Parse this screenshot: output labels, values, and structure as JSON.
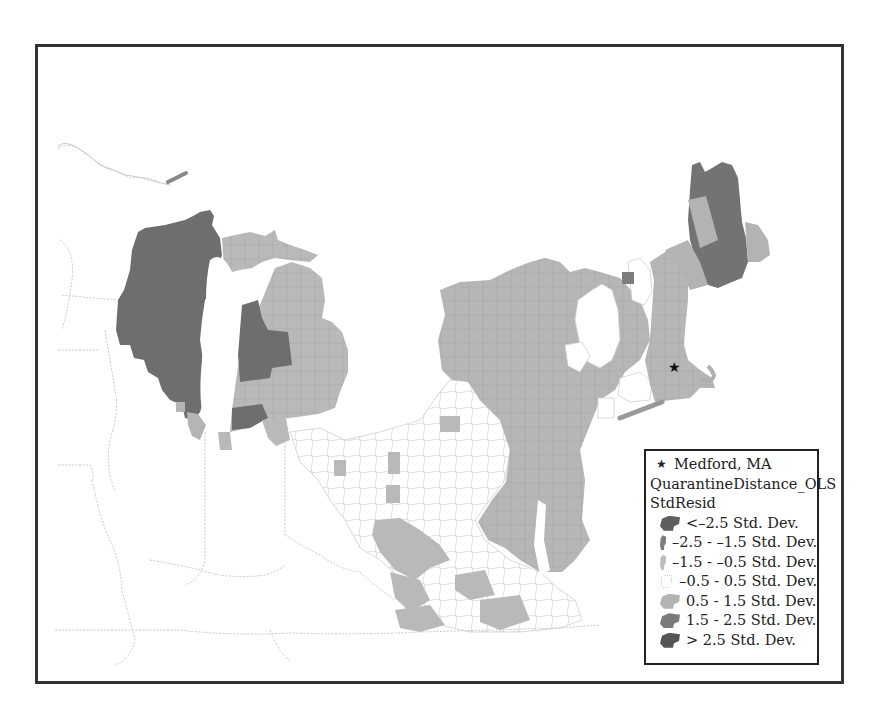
{
  "map": {
    "title": "",
    "colors": {
      "lt_-2.5": "#5e5e5e",
      "-2.5_-1.5": "#7d7d7d",
      "-1.5_-0.5": "#bdbdbd",
      "-0.5_0.5": "#ffffff",
      "0.5_1.5": "#b4b4b4",
      "1.5_2.5": "#7a7a7a",
      "gt_2.5": "#555555",
      "boundary": "#c8c8c8",
      "frame": "#333333"
    },
    "point_marker": {
      "label": "Medford, MA",
      "icon": "star-icon",
      "x": 675,
      "y": 369
    }
  },
  "legend": {
    "marker_label": "Medford, MA",
    "layer_name": "QuarantineDistance_OLS",
    "field_name": "StdResid",
    "classes": [
      {
        "label": "<–2.5 Std. Dev.",
        "color": "#5e5e5e"
      },
      {
        "label": "–2.5 - –1.5 Std. Dev.",
        "color": "#7d7d7d"
      },
      {
        "label": "–1.5 - –0.5 Std. Dev.",
        "color": "#bdbdbd"
      },
      {
        "label": "–0.5 - 0.5 Std. Dev.",
        "color": "#ffffff"
      },
      {
        "label": "0.5 - 1.5 Std. Dev.",
        "color": "#b4b4b4"
      },
      {
        "label": "1.5 - 2.5 Std. Dev.",
        "color": "#7a7a7a"
      },
      {
        "label": "> 2.5 Std. Dev.",
        "color": "#555555"
      }
    ]
  }
}
